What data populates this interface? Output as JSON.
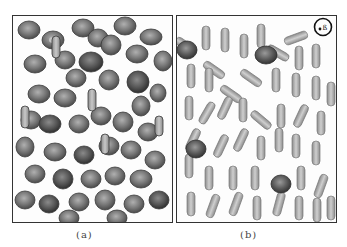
{
  "figure": {
    "panels": [
      {
        "id": "a",
        "caption": "(a)",
        "description": "Dense field of dark gray biconcave disc-shaped cells, a few elongated cells",
        "cell_fill": "#6e6e6e",
        "cell_stroke": "#3a3a3a",
        "highlight": "#b8b8b8"
      },
      {
        "id": "b",
        "caption": "(b)",
        "description": "Field of light gray elongated/elliptical cells with a few dark disc cells",
        "cell_fill": "#a8a8a8",
        "cell_stroke": "#7a7a7a",
        "highlight": "#dcdcdc",
        "marker": {
          "label": "circle-marker",
          "text": "•ß"
        }
      }
    ]
  }
}
